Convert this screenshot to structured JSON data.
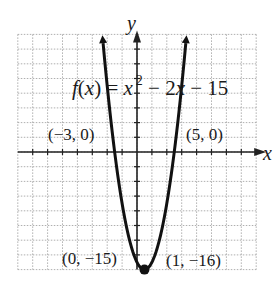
{
  "chart_data": {
    "type": "line",
    "title": "",
    "function_label": {
      "f": "f",
      "open": "(",
      "x": "x",
      "close": ")",
      "eq": " = ",
      "x2": "x",
      "exp": "2",
      "rest1": " − 2",
      "x3": "x",
      "rest2": " − 15"
    },
    "function": "f(x) = x^2 - 2x - 15",
    "xlabel": "x",
    "ylabel": "y",
    "xlim": [
      -16,
      16
    ],
    "ylim": [
      -16,
      16
    ],
    "grid": true,
    "grid_step": 2,
    "series": [
      {
        "name": "f(x) = x^2 - 2x - 15",
        "x": [
          -4.6,
          -4,
          -3,
          -2,
          -1,
          0,
          1,
          2,
          3,
          4,
          5,
          6,
          6.6
        ],
        "y": [
          15.4,
          9,
          0,
          -7,
          -12,
          -15,
          -16,
          -15,
          -12,
          -7,
          0,
          9,
          15.4
        ]
      }
    ],
    "annotations": [
      {
        "text": "(−3, 0)",
        "x": -3,
        "y": 0
      },
      {
        "text": "(5, 0)",
        "x": 5,
        "y": 0
      },
      {
        "text": "(0, −15)",
        "x": 0,
        "y": -15
      },
      {
        "text": "(1, −16)",
        "x": 1,
        "y": -16
      }
    ],
    "vertex": {
      "x": 1,
      "y": -16
    },
    "colors": {
      "curve": "#111111",
      "grid": "#9a9a9a",
      "axis": "#222222"
    }
  }
}
